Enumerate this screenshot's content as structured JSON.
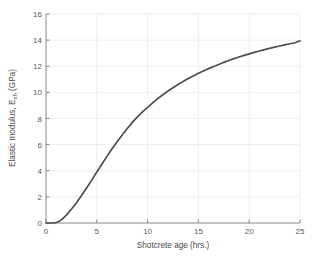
{
  "figure": {
    "background_color": "#ffffff",
    "width": 315,
    "height": 262
  },
  "chart_data": {
    "type": "line",
    "title": "",
    "xlabel": "Shotcrete age (hrs.)",
    "ylabel": "Elastic modulus, E",
    "ylabel_subscript": "sh",
    "ylabel_units": " (GPa)",
    "ylabel_full": "Elastic modulus, E_sh (GPa)",
    "xlim": [
      0,
      25
    ],
    "ylim": [
      0,
      16
    ],
    "xticks": [
      0,
      5,
      10,
      15,
      20,
      25
    ],
    "yticks": [
      0,
      2,
      4,
      6,
      8,
      10,
      12,
      14,
      16
    ],
    "xticklabels": [
      "0",
      "5",
      "10",
      "15",
      "20",
      "25"
    ],
    "yticklabels": [
      "0",
      "2",
      "4",
      "6",
      "8",
      "10",
      "12",
      "14",
      "16"
    ],
    "grid": true,
    "legend": null,
    "series": [
      {
        "name": "Shotcrete elastic modulus development",
        "color": "#4d4d4d",
        "line_width": 1.7,
        "x": [
          0,
          0.25,
          0.5,
          0.75,
          1.0,
          1.25,
          1.5,
          1.75,
          2.0,
          2.5,
          3.0,
          3.5,
          4.0,
          4.5,
          5.0,
          5.5,
          6.0,
          6.5,
          7.0,
          7.5,
          8.0,
          8.5,
          9.0,
          9.5,
          10.0,
          10.5,
          11.0,
          11.5,
          12.0,
          12.5,
          13.0,
          13.5,
          14.0,
          14.5,
          15.0,
          15.5,
          16.0,
          16.5,
          17.0,
          17.5,
          18.0,
          18.5,
          19.0,
          19.5,
          20.0,
          20.5,
          21.0,
          21.5,
          22.0,
          22.5,
          23.0,
          23.5,
          24.0,
          24.5,
          25.0
        ],
        "y": [
          0.0,
          0.0,
          0.0,
          0.01,
          0.04,
          0.12,
          0.24,
          0.4,
          0.6,
          1.05,
          1.55,
          2.1,
          2.68,
          3.28,
          3.9,
          4.5,
          5.1,
          5.68,
          6.22,
          6.74,
          7.24,
          7.7,
          8.12,
          8.5,
          8.86,
          9.2,
          9.52,
          9.82,
          10.1,
          10.36,
          10.6,
          10.84,
          11.06,
          11.26,
          11.46,
          11.64,
          11.82,
          11.98,
          12.14,
          12.3,
          12.44,
          12.58,
          12.71,
          12.83,
          12.95,
          13.06,
          13.17,
          13.27,
          13.37,
          13.46,
          13.55,
          13.64,
          13.72,
          13.8,
          13.95
        ]
      }
    ],
    "annotations": []
  },
  "axes": {
    "tick_color": "#7a7a7a",
    "grid_color": "#e8e8e8",
    "label_color": "#4a4a4a"
  }
}
